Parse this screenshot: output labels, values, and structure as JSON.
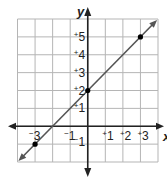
{
  "chart_data": {
    "type": "line",
    "title": "",
    "xlabel": "x",
    "ylabel": "y",
    "xlim": [
      -4,
      4
    ],
    "ylim": [
      -2,
      6
    ],
    "grid": true,
    "equation": "y = x + 2",
    "series": [
      {
        "name": "line",
        "x": [
          -3,
          0,
          3
        ],
        "y": [
          -1,
          2,
          5
        ],
        "color": "#555555",
        "marked_points": true,
        "arrows_both_ends": true
      }
    ],
    "x_tick_labels": [
      {
        "value": -3,
        "sign": "−",
        "num": "3"
      },
      {
        "value": -1,
        "sign": "−",
        "num": "1"
      },
      {
        "value": 1,
        "sign": "+",
        "num": "1"
      },
      {
        "value": 2,
        "sign": "+",
        "num": "2"
      },
      {
        "value": 3,
        "sign": "+",
        "num": "3"
      }
    ],
    "y_tick_labels": [
      {
        "value": 5,
        "sign": "+",
        "num": "5"
      },
      {
        "value": 4,
        "sign": "+",
        "num": "4"
      },
      {
        "value": 3,
        "sign": "+",
        "num": "3"
      },
      {
        "value": 2,
        "sign": "+",
        "num": "2"
      },
      {
        "value": 1,
        "sign": "+",
        "num": "1"
      },
      {
        "value": -1,
        "sign": "−",
        "num": "1"
      }
    ]
  },
  "colors": {
    "grid": "#b5b5b5",
    "axis": "#222222",
    "line": "#555555",
    "point": "#000000"
  }
}
